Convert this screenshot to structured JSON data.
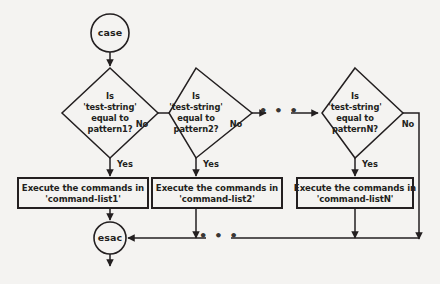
{
  "diagram": {
    "colors": {
      "background": "#f4f3f1",
      "stroke": "#231f20",
      "shape_fill": "#f4f3f1"
    },
    "start_node": {
      "label": "case"
    },
    "end_node": {
      "label": "esac"
    },
    "branches": [
      {
        "condition_lines": [
          "Is",
          "'test-string'",
          "equal to",
          "pattern1?"
        ],
        "no_label": "No",
        "yes_label": "Yes",
        "action_lines": [
          "Execute the commands in",
          "'command-list1'"
        ]
      },
      {
        "condition_lines": [
          "Is",
          "'test-string'",
          "equal to",
          "pattern2?"
        ],
        "no_label": "No",
        "yes_label": "Yes",
        "action_lines": [
          "Execute the commands in",
          "'command-list2'"
        ]
      },
      {
        "condition_lines": [
          "Is",
          "'test-string'",
          "equal to",
          "patternN?"
        ],
        "no_label": "No",
        "yes_label": "Yes",
        "action_lines": [
          "Execute the commands in",
          "'command-listN'"
        ]
      }
    ],
    "ellipsis_top": "• • •",
    "ellipsis_bottom": "• • •"
  }
}
